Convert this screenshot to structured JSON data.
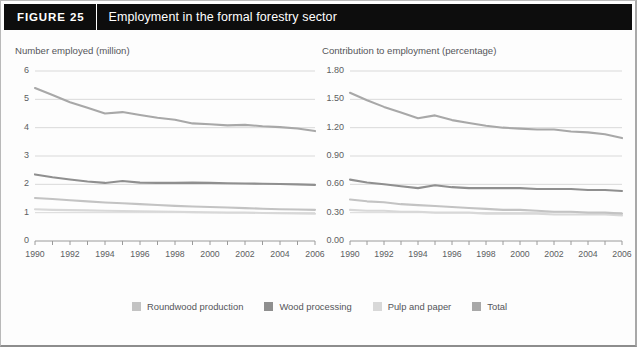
{
  "figure": {
    "number_label": "FIGURE  25",
    "title": "Employment in the formal forestry sector"
  },
  "legend": {
    "items": [
      {
        "label": "Roundwood production",
        "color": "#c3c3c3"
      },
      {
        "label": "Wood processing",
        "color": "#8f8f8f"
      },
      {
        "label": "Pulp and paper",
        "color": "#d8d8d8"
      },
      {
        "label": "Total",
        "color": "#a8a8a8"
      }
    ]
  },
  "chart_data": [
    {
      "type": "line",
      "id": "number-employed",
      "title": "Number employed (million)",
      "xlabel": "",
      "ylabel": "Number employed (million)",
      "x": [
        1990,
        1991,
        1992,
        1993,
        1994,
        1995,
        1996,
        1997,
        1998,
        1999,
        2000,
        2001,
        2002,
        2003,
        2004,
        2005,
        2006
      ],
      "xtick_labels": [
        "1990",
        "1992",
        "1994",
        "1996",
        "1998",
        "2000",
        "2002",
        "2004",
        "2006"
      ],
      "xlim": [
        1990,
        2006
      ],
      "ylim": [
        0,
        6
      ],
      "yticks": [
        "0",
        "1",
        "2",
        "3",
        "4",
        "5",
        "6"
      ],
      "grid": true,
      "legend_position": "bottom",
      "series": [
        {
          "name": "Total",
          "color": "#a8a8a8",
          "values": [
            5.4,
            5.15,
            4.9,
            4.7,
            4.5,
            4.55,
            4.45,
            4.35,
            4.28,
            4.15,
            4.12,
            4.08,
            4.1,
            4.05,
            4.02,
            3.97,
            3.88
          ]
        },
        {
          "name": "Wood processing",
          "color": "#8f8f8f",
          "values": [
            2.35,
            2.25,
            2.17,
            2.1,
            2.05,
            2.12,
            2.06,
            2.05,
            2.05,
            2.06,
            2.05,
            2.04,
            2.03,
            2.02,
            2.01,
            2.0,
            1.98
          ]
        },
        {
          "name": "Roundwood production",
          "color": "#c3c3c3",
          "values": [
            1.52,
            1.48,
            1.44,
            1.4,
            1.36,
            1.33,
            1.3,
            1.27,
            1.24,
            1.22,
            1.2,
            1.18,
            1.16,
            1.14,
            1.12,
            1.11,
            1.1
          ]
        },
        {
          "name": "Pulp and paper",
          "color": "#d8d8d8",
          "values": [
            1.12,
            1.1,
            1.09,
            1.08,
            1.07,
            1.06,
            1.05,
            1.04,
            1.03,
            1.02,
            1.01,
            1.0,
            1.0,
            0.99,
            0.98,
            0.97,
            0.96
          ]
        }
      ]
    },
    {
      "type": "line",
      "id": "contribution-to-employment",
      "title": "Contribution to employment (percentage)",
      "xlabel": "",
      "ylabel": "Contribution to employment (percentage)",
      "x": [
        1990,
        1991,
        1992,
        1993,
        1994,
        1995,
        1996,
        1997,
        1998,
        1999,
        2000,
        2001,
        2002,
        2003,
        2004,
        2005,
        2006
      ],
      "xtick_labels": [
        "1990",
        "1992",
        "1994",
        "1996",
        "1998",
        "2000",
        "2002",
        "2004",
        "2006"
      ],
      "xlim": [
        1990,
        2006
      ],
      "ylim": [
        0.0,
        1.8
      ],
      "yticks": [
        "0.00",
        "0.30",
        "0.60",
        "0.90",
        "1.20",
        "1.50",
        "1.80"
      ],
      "grid": true,
      "legend_position": "bottom",
      "series": [
        {
          "name": "Total",
          "color": "#a8a8a8",
          "values": [
            1.57,
            1.49,
            1.42,
            1.36,
            1.3,
            1.33,
            1.28,
            1.25,
            1.22,
            1.2,
            1.19,
            1.18,
            1.18,
            1.16,
            1.15,
            1.13,
            1.09
          ]
        },
        {
          "name": "Wood processing",
          "color": "#8f8f8f",
          "values": [
            0.65,
            0.62,
            0.6,
            0.58,
            0.56,
            0.59,
            0.57,
            0.56,
            0.56,
            0.56,
            0.56,
            0.55,
            0.55,
            0.55,
            0.54,
            0.54,
            0.53
          ]
        },
        {
          "name": "Roundwood production",
          "color": "#c3c3c3",
          "values": [
            0.44,
            0.42,
            0.41,
            0.39,
            0.38,
            0.37,
            0.36,
            0.35,
            0.34,
            0.33,
            0.33,
            0.32,
            0.31,
            0.31,
            0.3,
            0.3,
            0.29
          ]
        },
        {
          "name": "Pulp and paper",
          "color": "#d8d8d8",
          "values": [
            0.33,
            0.32,
            0.32,
            0.31,
            0.31,
            0.3,
            0.3,
            0.3,
            0.29,
            0.29,
            0.29,
            0.29,
            0.28,
            0.28,
            0.28,
            0.28,
            0.27
          ]
        }
      ]
    }
  ]
}
